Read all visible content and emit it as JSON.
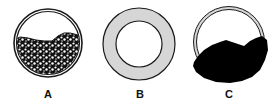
{
  "diagram": {
    "panels": [
      {
        "label": "A",
        "description": "Ring filled partially from bottom with speckled granular material"
      },
      {
        "label": "B",
        "description": "Empty gray annulus (thick ring) with white center"
      },
      {
        "label": "C",
        "description": "Thin ring with solid black mass overflowing bottom and right side"
      }
    ],
    "colors": {
      "outline": "#1a1a1a",
      "ring_fill": "#d6d6d6",
      "solid_mass": "#000000",
      "background": "#ffffff"
    }
  }
}
